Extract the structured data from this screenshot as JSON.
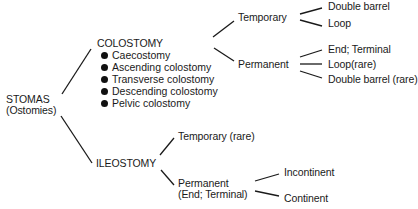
{
  "diagram": {
    "type": "tree",
    "root": {
      "label_line1": "STOMAS",
      "label_line2": "(Ostomies)"
    },
    "colostomy": {
      "label": "COLOSTOMY",
      "subtypes": [
        "Caecostomy",
        "Ascending colostomy",
        "Transverse colostomy",
        "Descending colostomy",
        "Pelvic colostomy"
      ],
      "temporary": {
        "label": "Temporary",
        "children": [
          "Double barrel",
          "Loop"
        ]
      },
      "permanent": {
        "label": "Permanent",
        "children": [
          "End; Terminal",
          "Loop(rare)",
          "Double barrel (rare)"
        ]
      }
    },
    "ileostomy": {
      "label": "ILEOSTOMY",
      "temporary": {
        "label": "Temporary (rare)"
      },
      "permanent": {
        "label_line1": "Permanent",
        "label_line2": "(End; Terminal)",
        "children": [
          "Incontinent",
          "Continent"
        ]
      }
    }
  }
}
